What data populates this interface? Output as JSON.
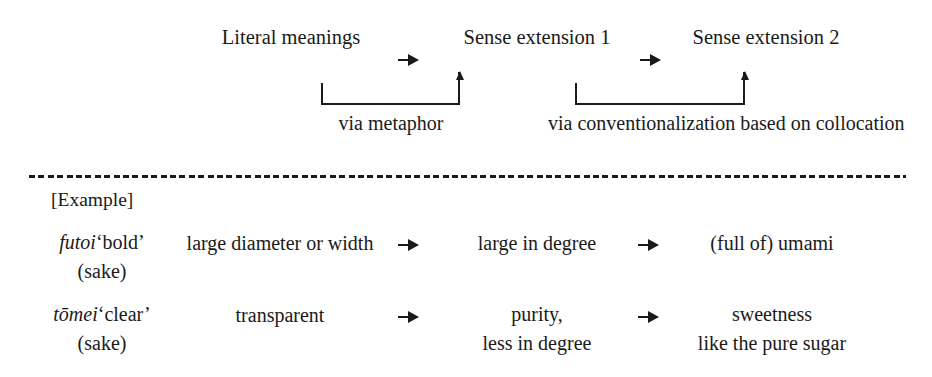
{
  "figure": {
    "stages": [
      {
        "label": "Literal meanings"
      },
      {
        "label": "Sense extension 1"
      },
      {
        "label": "Sense extension 2"
      }
    ],
    "stage_connectors": [
      {
        "icon": "arrow-right-icon"
      },
      {
        "icon": "arrow-right-icon"
      }
    ],
    "mechanisms": [
      {
        "line1": "via metaphor",
        "line2": ""
      },
      {
        "line1": "via conventionalization",
        "line2": "based on collocation"
      }
    ],
    "example_section": {
      "heading": "[Example]",
      "rows": [
        {
          "headword": "futoi",
          "headword_gloss": "‘bold’",
          "headword_context": "(sake)",
          "literal": {
            "line1": "large diameter or width",
            "line2": ""
          },
          "sense_1": {
            "line1": "large in degree",
            "line2": ""
          },
          "sense_2": {
            "line1": "(full of) umami",
            "line2": ""
          },
          "connector_1": "arrow-right-icon",
          "connector_2": "arrow-right-icon"
        },
        {
          "headword": "tōmei",
          "headword_gloss": "‘clear’",
          "headword_context": "(sake)",
          "literal": {
            "line1": "transparent",
            "line2": ""
          },
          "sense_1": {
            "line1": "purity,",
            "line2": "less in degree"
          },
          "sense_2": {
            "line1": "sweetness",
            "line2": "like the pure sugar"
          },
          "connector_1": "arrow-right-icon",
          "connector_2": "arrow-right-icon"
        }
      ]
    },
    "divider": {
      "style": "dashed"
    },
    "colors": {
      "ink": "#1a1a1a",
      "background": "#ffffff"
    }
  }
}
